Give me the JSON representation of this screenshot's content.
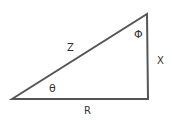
{
  "diagram": {
    "type": "right-triangle",
    "stroke_color": "#555555",
    "vertices": {
      "bottom_left": [
        12,
        99
      ],
      "top_right": [
        147,
        14
      ],
      "bottom_right": [
        148,
        99
      ]
    },
    "labels": {
      "hypotenuse": "Z",
      "vertical_side": "X",
      "base": "R",
      "angle_bottom_left": "θ",
      "angle_top": "Φ"
    }
  }
}
